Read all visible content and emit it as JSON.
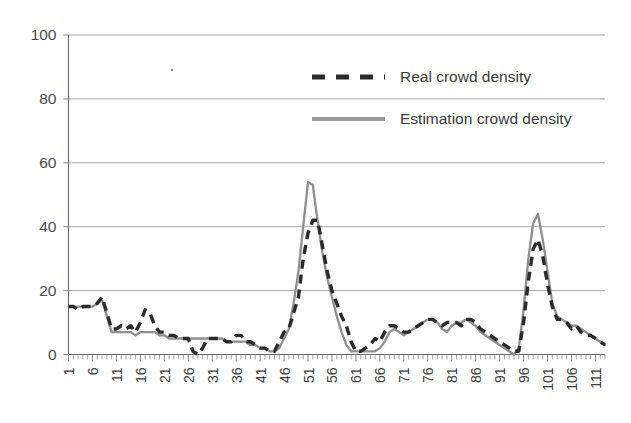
{
  "chart_data": {
    "type": "line",
    "title": "",
    "xlabel": "",
    "ylabel": "",
    "ylim": [
      0,
      100
    ],
    "xlim": [
      1,
      113
    ],
    "grid": true,
    "grid_axis": "y",
    "legend_position": "top-right",
    "ytick_labels": [
      "0",
      "20",
      "40",
      "60",
      "80",
      "100"
    ],
    "ytick_values": [
      0,
      20,
      40,
      60,
      80,
      100
    ],
    "xtick_labels": [
      "1",
      "6",
      "11",
      "16",
      "21",
      "26",
      "31",
      "36",
      "41",
      "46",
      "51",
      "56",
      "61",
      "66",
      "71",
      "76",
      "81",
      "86",
      "91",
      "96",
      "101",
      "106",
      "111"
    ],
    "xtick_values": [
      1,
      6,
      11,
      16,
      21,
      26,
      31,
      36,
      41,
      46,
      51,
      56,
      61,
      66,
      71,
      76,
      81,
      86,
      91,
      96,
      101,
      106,
      111
    ],
    "x": [
      1,
      2,
      3,
      4,
      5,
      6,
      7,
      8,
      9,
      10,
      11,
      12,
      13,
      14,
      15,
      16,
      17,
      18,
      19,
      20,
      21,
      22,
      23,
      24,
      25,
      26,
      27,
      28,
      29,
      30,
      31,
      32,
      33,
      34,
      35,
      36,
      37,
      38,
      39,
      40,
      41,
      42,
      43,
      44,
      45,
      46,
      47,
      48,
      49,
      50,
      51,
      52,
      53,
      54,
      55,
      56,
      57,
      58,
      59,
      60,
      61,
      62,
      63,
      64,
      65,
      66,
      67,
      68,
      69,
      70,
      71,
      72,
      73,
      74,
      75,
      76,
      77,
      78,
      79,
      80,
      81,
      82,
      83,
      84,
      85,
      86,
      87,
      88,
      89,
      90,
      91,
      92,
      93,
      94,
      95,
      96,
      97,
      98,
      99,
      100,
      101,
      102,
      103,
      104,
      105,
      106,
      107,
      108,
      109,
      110,
      111,
      112,
      113
    ],
    "series": [
      {
        "name": "Real crowd density",
        "style": "dashed",
        "color": "#2b2b2b",
        "values": [
          15,
          15,
          14,
          15,
          15,
          15,
          16,
          18,
          13,
          8,
          8,
          9,
          8,
          9,
          7,
          10,
          14,
          13,
          9,
          7,
          7,
          6,
          6,
          5,
          5,
          5,
          1,
          0,
          2,
          5,
          5,
          5,
          5,
          4,
          4,
          6,
          6,
          4,
          4,
          3,
          2,
          2,
          1,
          1,
          4,
          7,
          8,
          13,
          18,
          30,
          38,
          42,
          42,
          34,
          26,
          20,
          16,
          12,
          9,
          4,
          1,
          1,
          2,
          3,
          5,
          4,
          7,
          9,
          9,
          8,
          7,
          7,
          8,
          9,
          10,
          11,
          11,
          10,
          9,
          10,
          10,
          10,
          9,
          11,
          11,
          10,
          8,
          7,
          6,
          5,
          4,
          3,
          2,
          1,
          1,
          10,
          23,
          33,
          36,
          31,
          22,
          15,
          11,
          11,
          10,
          8,
          9,
          7,
          6,
          6,
          5,
          4,
          3
        ]
      },
      {
        "name": "Estimation crowd density",
        "style": "solid",
        "color": "#8e8e8e",
        "values": [
          15,
          15,
          15,
          15,
          15,
          15,
          16,
          17,
          12,
          7,
          7,
          7,
          7,
          7,
          6,
          7,
          7,
          7,
          7,
          6,
          6,
          5,
          5,
          5,
          5,
          5,
          5,
          5,
          5,
          5,
          5,
          5,
          5,
          4,
          4,
          4,
          4,
          4,
          3,
          3,
          2,
          2,
          1,
          1,
          2,
          5,
          8,
          16,
          26,
          40,
          54,
          53,
          42,
          32,
          24,
          18,
          12,
          7,
          3,
          1,
          1,
          1,
          1,
          1,
          1,
          2,
          4,
          7,
          8,
          7,
          6,
          7,
          8,
          9,
          10,
          11,
          11,
          10,
          8,
          7,
          9,
          10,
          10,
          11,
          10,
          9,
          7,
          6,
          5,
          4,
          3,
          2,
          1,
          0,
          2,
          14,
          30,
          41,
          44,
          36,
          26,
          16,
          12,
          11,
          10,
          9,
          9,
          8,
          7,
          6,
          5,
          4,
          3
        ]
      }
    ],
    "legend": [
      {
        "label": "Real crowd density",
        "swatch": "dashed-black"
      },
      {
        "label": "Estimation crowd density",
        "swatch": "solid-gray"
      }
    ]
  },
  "colors": {
    "real_series": "#2b2b2b",
    "estimation_series": "#8e8e8e",
    "gridline": "#9a9a9a",
    "axis": "#6b6b6b",
    "tick_text": "#3d3d3d",
    "background": "#ffffff"
  }
}
